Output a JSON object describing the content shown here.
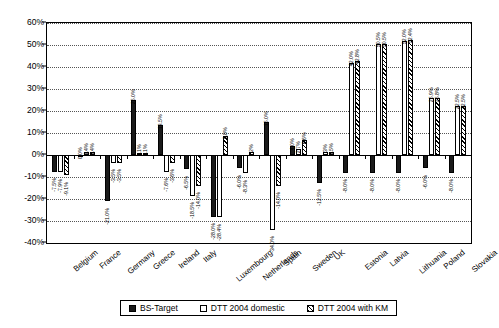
{
  "chart_data": {
    "type": "bar",
    "title": "",
    "xlabel": "",
    "ylabel": "",
    "ylim": [
      -40,
      60
    ],
    "ytick_step": 10,
    "grid": true,
    "legend_position": "bottom",
    "ytick_labels": [
      "60%",
      "50%",
      "40%",
      "30%",
      "20%",
      "10%",
      "0%",
      "-10%",
      "-20%",
      "-30%",
      "-40%"
    ],
    "categories": [
      "Belgium",
      "France",
      "Germany",
      "Greece",
      "Ireland",
      "Italy",
      "Luxembourg",
      "Netherlands",
      "Spain",
      "Sweden",
      "UK",
      "Estonia",
      "Latvia",
      "Lithuania",
      "Poland",
      "Slovakia"
    ],
    "series": [
      {
        "name": "BS-Target",
        "style": "solid-black",
        "values": [
          -7.5,
          0.0,
          -21.0,
          25.0,
          13.5,
          -6.5,
          -28.0,
          -6.0,
          15.0,
          4.0,
          -12.5,
          -8.0,
          -8.0,
          -8.0,
          -6.0,
          -8.0
        ],
        "labels": [
          "-7.5%",
          "0.0%",
          "-21.0%",
          "25.0%",
          "13.5%",
          "-6.5%",
          "-28.0%",
          "-6.0%",
          "15.0%",
          "4.0%",
          "-12.5%",
          "-8.0%",
          "-8.0%",
          "-8.0%",
          "-6.0%",
          "-8.0%"
        ]
      },
      {
        "name": "DTT 2004 domestic",
        "style": "white",
        "values": [
          -7.9,
          1.4,
          -3.5,
          1.1,
          -7.6,
          -18.5,
          -28.4,
          -8.3,
          -34.0,
          2.7,
          1.3,
          42.0,
          50.5,
          52.0,
          25.9,
          22.5
        ],
        "labels": [
          "-7.9%",
          "1.4%",
          "-3.5%",
          "1.1%",
          "-7.6%",
          "-18.5%",
          "-28.4%",
          "-8.3%",
          "-34.0%",
          "2.7%",
          "1.3%",
          "42.0%",
          "50.5%",
          "52.0%",
          "25.9%",
          "22.5%"
        ]
      },
      {
        "name": "DTT 2004 with KM",
        "style": "hatched",
        "values": [
          -9.1,
          1.4,
          -3.5,
          1.1,
          -3.6,
          -14.0,
          8.8,
          1.2,
          -14.0,
          6.6,
          1.5,
          42.8,
          50.5,
          52.4,
          25.8,
          22.5
        ],
        "labels": [
          "-9.1%",
          "1.4%",
          "-3.5%",
          "1.1%",
          "-3.6%",
          "-14.0%",
          "8.8%",
          "1.2%",
          "-14.0%",
          "6.6%",
          "1.5%",
          "42.8%",
          "50.5%",
          "52.4%",
          "25.8%",
          "22.5%"
        ]
      }
    ]
  },
  "legend": {
    "items": [
      {
        "label": "BS-Target"
      },
      {
        "label": "DTT 2004 domestic"
      },
      {
        "label": "DTT 2004 with KM"
      }
    ]
  }
}
